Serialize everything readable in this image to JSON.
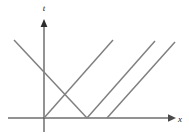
{
  "figure": {
    "background_color": "#ffffff",
    "width": 189,
    "height": 140
  },
  "axes": {
    "vertical": {
      "label": "t",
      "name": "t-axis",
      "color": "#4a4a4a",
      "x": 44,
      "y_top": 22,
      "y_bottom": 132,
      "arrow": "up",
      "label_x": 44,
      "label_y": 11
    },
    "horizontal": {
      "label": "x",
      "name": "x-axis",
      "color": "#6e6e6e",
      "y": 118,
      "x_left": 8,
      "x_right": 170,
      "arrow": "right",
      "label_x": 180,
      "label_y": 122
    },
    "origin": {
      "x": 44,
      "y": 118
    }
  },
  "chart_data": {
    "type": "line",
    "xlabel": "x",
    "ylabel": "t",
    "grid": false,
    "legend": "none",
    "series": [
      {
        "name": "descending-line",
        "slope": "negative",
        "color": "#808080",
        "points": [
          [
            14,
            40
          ],
          [
            87,
            118
          ]
        ]
      },
      {
        "name": "ascending-line-1",
        "slope": "positive",
        "color": "#808080",
        "points": [
          [
            44,
            118
          ],
          [
            113,
            40
          ]
        ]
      },
      {
        "name": "ascending-line-2",
        "slope": "positive",
        "color": "#808080",
        "points": [
          [
            87,
            118
          ],
          [
            155,
            41
          ]
        ]
      },
      {
        "name": "ascending-line-3",
        "slope": "positive",
        "color": "#808080",
        "points": [
          [
            107,
            118
          ],
          [
            175,
            42
          ]
        ]
      }
    ],
    "annotations": [
      {
        "name": "crossing-point",
        "x": 68,
        "y": 95,
        "label": ""
      }
    ]
  }
}
